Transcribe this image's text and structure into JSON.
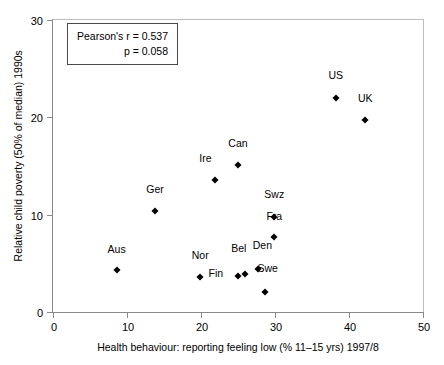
{
  "chart_data": {
    "type": "scatter",
    "title": "",
    "xlabel": "Health behaviour:  reporting feeling low (% 11–15 yrs) 1997/8",
    "ylabel": "Relative child poverty (50% of median) 1990s",
    "xlim": [
      0,
      50
    ],
    "ylim": [
      0,
      30
    ],
    "xticks": [
      "0",
      "10",
      "20",
      "30",
      "40",
      "50"
    ],
    "yticks": [
      "0",
      "10",
      "20",
      "30"
    ],
    "grid": false,
    "legend": "none",
    "annotations": [
      "Pearson's r = 0.537",
      "p = 0.058"
    ],
    "points": [
      {
        "label": "Aus",
        "x": 8.6,
        "y": 4.3,
        "lx": 8.6,
        "ly": 6.0
      },
      {
        "label": "Ger",
        "x": 13.8,
        "y": 10.4,
        "lx": 13.8,
        "ly": 12.1
      },
      {
        "label": "Nor",
        "x": 19.9,
        "y": 3.6,
        "lx": 19.9,
        "ly": 5.3
      },
      {
        "label": "Ire",
        "x": 21.9,
        "y": 13.6,
        "lx": 20.6,
        "ly": 15.3
      },
      {
        "label": "Fin",
        "x": 25.0,
        "y": 3.7,
        "lx": 22.0,
        "ly": 3.5
      },
      {
        "label": "Can",
        "x": 25.0,
        "y": 15.1,
        "lx": 25.0,
        "ly": 16.9
      },
      {
        "label": "Bel",
        "x": 25.9,
        "y": 3.9,
        "lx": 25.1,
        "ly": 6.1
      },
      {
        "label": "Den",
        "x": 27.7,
        "y": 4.4,
        "lx": 28.3,
        "ly": 6.4
      },
      {
        "label": "Swe",
        "x": 28.6,
        "y": 2.1,
        "lx": 29.0,
        "ly": 4.0
      },
      {
        "label": "Swz",
        "x": 29.9,
        "y": 9.8,
        "lx": 29.9,
        "ly": 11.6
      },
      {
        "label": "Fra",
        "x": 29.9,
        "y": 7.7,
        "lx": 29.9,
        "ly": 9.4
      },
      {
        "label": "US",
        "x": 38.2,
        "y": 22.0,
        "lx": 38.2,
        "ly": 23.8
      },
      {
        "label": "UK",
        "x": 42.2,
        "y": 19.7,
        "lx": 42.2,
        "ly": 21.5
      }
    ]
  }
}
